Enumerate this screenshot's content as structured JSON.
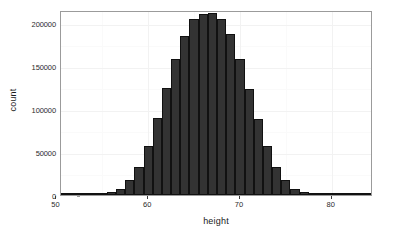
{
  "chart_data": {
    "type": "bar",
    "title": "",
    "subtitle": "",
    "xlabel": "height",
    "ylabel": "count",
    "xlim": [
      50.5,
      84.5
    ],
    "ylim": [
      0,
      215000
    ],
    "grid": true,
    "legend": "none",
    "x_ticks": [
      50,
      60,
      70,
      80
    ],
    "x_tick_labels": [
      "50",
      "60",
      "70",
      "80"
    ],
    "y_ticks": [
      0,
      50000,
      100000,
      150000,
      200000
    ],
    "y_tick_labels": [
      "0",
      "50000",
      "100000",
      "150000",
      "200000"
    ],
    "x_minor_ticks": [
      55,
      65,
      75
    ],
    "y_minor_ticks": [
      25000,
      75000,
      125000,
      175000
    ],
    "bin_width": 1,
    "bar_fill": "#333333",
    "bar_stroke": "#111111",
    "panel_border": "#9b9b9b",
    "categories": [
      51,
      52,
      53,
      54,
      55,
      56,
      57,
      58,
      59,
      60,
      61,
      62,
      63,
      64,
      65,
      66,
      67,
      68,
      69,
      70,
      71,
      72,
      73,
      74,
      75,
      76,
      77,
      78,
      79,
      80,
      81,
      82,
      83,
      84
    ],
    "values": [
      300,
      400,
      600,
      900,
      1500,
      3000,
      7000,
      17000,
      33000,
      57000,
      89000,
      124000,
      158000,
      185000,
      204000,
      210000,
      211000,
      204000,
      187000,
      158000,
      123000,
      88000,
      57000,
      33000,
      17000,
      7000,
      3000,
      1500,
      900,
      600,
      400,
      300,
      200,
      150
    ]
  }
}
